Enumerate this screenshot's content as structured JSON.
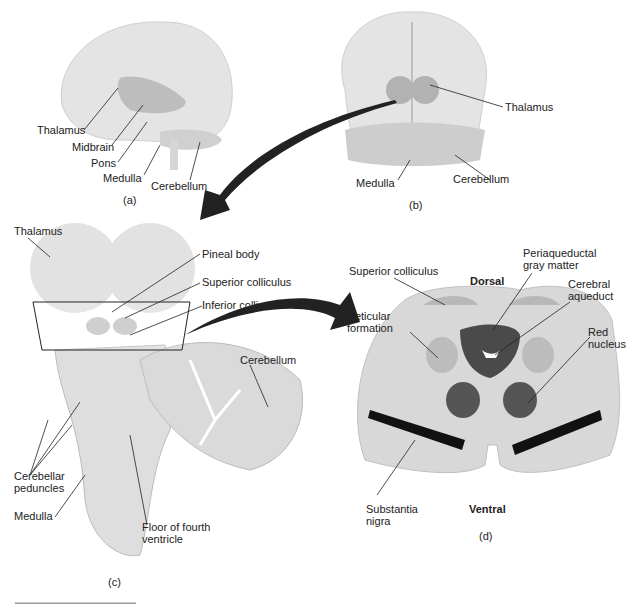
{
  "panels": {
    "a": {
      "caption": "(a)",
      "labels": {
        "thalamus": "Thalamus",
        "midbrain": "Midbrain",
        "pons": "Pons",
        "medulla": "Medulla",
        "cerebellum": "Cerebellum"
      }
    },
    "b": {
      "caption": "(b)",
      "labels": {
        "thalamus": "Thalamus",
        "medulla": "Medulla",
        "cerebellum": "Cerebellum"
      }
    },
    "c": {
      "caption": "(c)",
      "labels": {
        "thalamus": "Thalamus",
        "pineal_body": "Pineal body",
        "superior_colliculus": "Superior colliculus",
        "inferior_colliculus": "Inferior colliculus",
        "cerebellum": "Cerebellum",
        "cerebellar_peduncles_1": "Cerebellar",
        "cerebellar_peduncles_2": "peduncles",
        "medulla": "Medulla",
        "floor_1": "Floor of fourth",
        "floor_2": "ventricle"
      }
    },
    "d": {
      "caption": "(d)",
      "labels": {
        "superior_colliculus": "Superior colliculus",
        "dorsal": "Dorsal",
        "periaqueductal_1": "Periaqueductal",
        "periaqueductal_2": "gray matter",
        "cerebral_aqueduct_1": "Cerebral",
        "cerebral_aqueduct_2": "aqueduct",
        "reticular_1": "Reticular",
        "reticular_2": "formation",
        "red_nucleus_1": "Red",
        "red_nucleus_2": "nucleus",
        "substantia_1": "Substantia",
        "substantia_2": "nigra",
        "ventral": "Ventral"
      }
    }
  },
  "colors": {
    "brain": "#e3e3e3",
    "highlight": "#b5b5b5",
    "dark": "#555555",
    "black": "#111111",
    "section": "#d6d6d6"
  }
}
